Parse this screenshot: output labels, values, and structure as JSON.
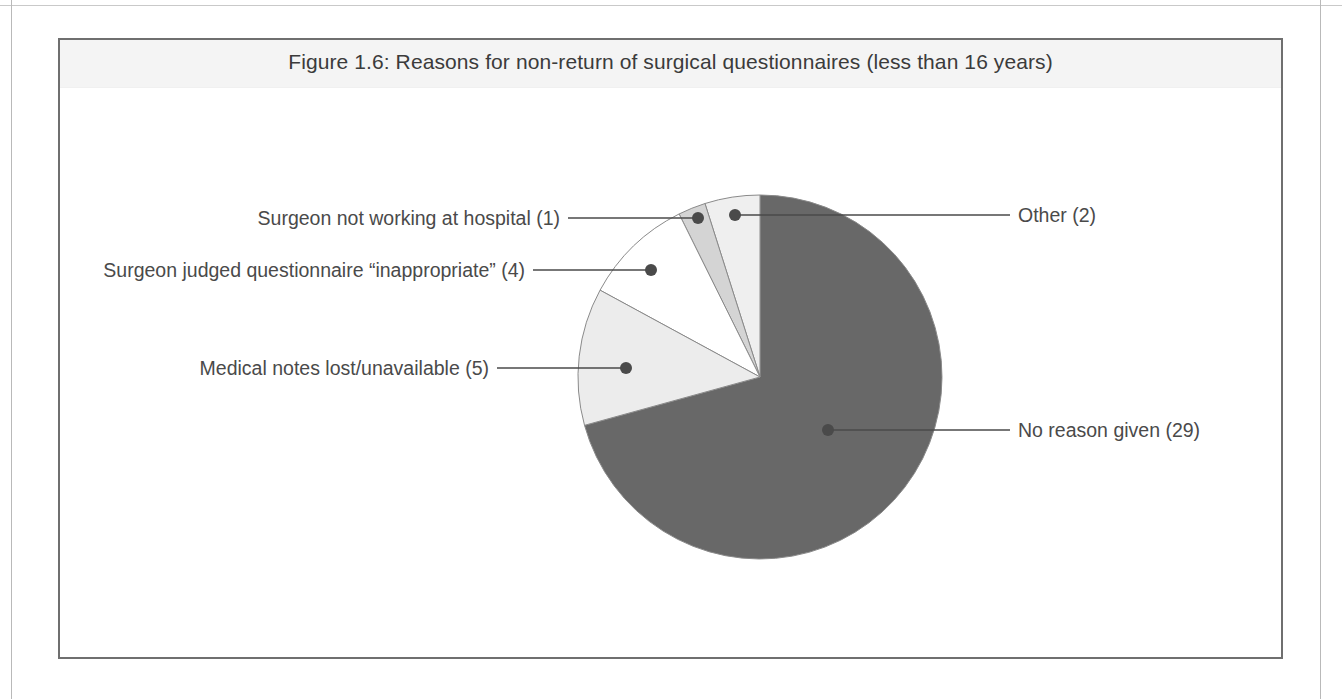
{
  "figure": {
    "title": "Figure 1.6: Reasons for non-return of surgical questionnaires (less than 16 years)",
    "frame_color": "#6f6f6f",
    "title_band_color": "#f4f4f4",
    "text_color": "#4a4a4a"
  },
  "chart_data": {
    "type": "pie",
    "title": "Figure 1.6: Reasons for non-return of surgical questionnaires (less than 16 years)",
    "xlabel": "",
    "ylabel": "",
    "total": 41,
    "labels": [
      "No reason given (29)",
      "Other (2)",
      "Surgeon not working at hospital (1)",
      "Surgeon judged questionnaire “inappropriate” (4)",
      "Medical notes lost/unavailable (5)"
    ],
    "categories": [
      "No reason given",
      "Other",
      "Surgeon not working at hospital",
      "Surgeon judged questionnaire “inappropriate”",
      "Medical notes lost/unavailable"
    ],
    "values": [
      29,
      2,
      1,
      4,
      5
    ],
    "colors": [
      "#686868",
      "#efefef",
      "#d4d4d4",
      "#ffffff",
      "#ececec"
    ],
    "legend_position": "callout-labels",
    "grid": false,
    "slices": [
      {
        "name": "No reason given",
        "label": "No reason given (29)",
        "value": 29,
        "percent": "70.7%",
        "color": "#686868",
        "start_deg": 0,
        "end_deg": 254.6,
        "leader_side": "right",
        "dot_x": 828,
        "dot_y": 430,
        "line_end_x": 1010,
        "line_end_y": 430,
        "label_x": 1018,
        "label_y": 419
      },
      {
        "name": "Other",
        "label": "Other (2)",
        "value": 2,
        "percent": "4.9%",
        "color": "#efefef",
        "start_deg": 342.4,
        "end_deg": 360,
        "leader_side": "right",
        "dot_x": 735,
        "dot_y": 215,
        "line_end_x": 1010,
        "line_end_y": 215,
        "label_x": 1018,
        "label_y": 204
      },
      {
        "name": "Surgeon not working at hospital",
        "label": "Surgeon not working at hospital (1)",
        "value": 1,
        "percent": "2.4%",
        "color": "#d4d4d4",
        "start_deg": 333.6,
        "end_deg": 342.4,
        "leader_side": "left",
        "dot_x": 698,
        "dot_y": 218,
        "line_end_x": 568,
        "line_end_y": 218,
        "label_x": 560,
        "label_y": 207
      },
      {
        "name": "Surgeon judged questionnaire “inappropriate”",
        "label": "Surgeon judged questionnaire “inappropriate” (4)",
        "value": 4,
        "percent": "9.8%",
        "color": "#ffffff",
        "start_deg": 298.5,
        "end_deg": 333.6,
        "leader_side": "left",
        "dot_x": 651,
        "dot_y": 270,
        "line_end_x": 533,
        "line_end_y": 270,
        "label_x": 525,
        "label_y": 259
      },
      {
        "name": "Medical notes lost/unavailable",
        "label": "Medical notes lost/unavailable (5)",
        "value": 5,
        "percent": "12.2%",
        "color": "#ececec",
        "start_deg": 254.6,
        "end_deg": 298.5,
        "leader_side": "left",
        "dot_x": 626,
        "dot_y": 368,
        "line_end_x": 497,
        "line_end_y": 368,
        "label_x": 489,
        "label_y": 357
      }
    ],
    "geometry": {
      "center_x": 760,
      "center_y": 377,
      "radius": 182,
      "outline_color": "#8a8a8a",
      "leader_color": "#4a4a4a",
      "dot_radius": 6
    }
  }
}
